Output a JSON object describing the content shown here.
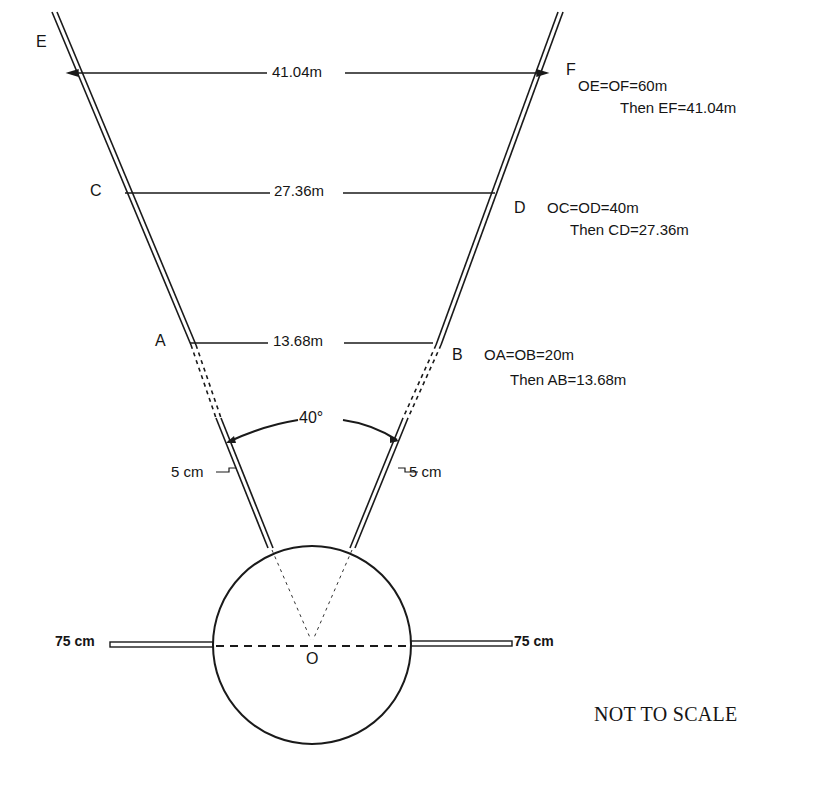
{
  "diagram": {
    "points": {
      "E": "E",
      "F": "F",
      "C": "C",
      "D": "D",
      "A": "A",
      "B": "B",
      "O": "O"
    },
    "spans": {
      "EF": "41.04m",
      "CD": "27.36m",
      "AB": "13.68m"
    },
    "annotations": {
      "ef_given": "OE=OF=60m",
      "ef_result": "Then EF=41.04m",
      "cd_given": "OC=OD=40m",
      "cd_result": "Then CD=27.36m",
      "ab_given": "OA=OB=20m",
      "ab_result": "Then AB=13.68m"
    },
    "angle": "40°",
    "tube_width_left": "5 cm",
    "tube_width_right": "5 cm",
    "arm_left": "75 cm",
    "arm_right": "75 cm",
    "note": "NOT TO SCALE"
  }
}
